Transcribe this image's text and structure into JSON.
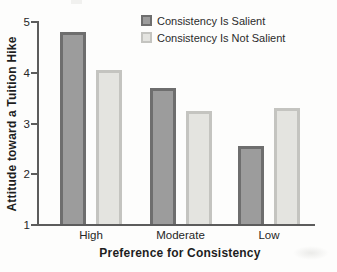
{
  "chart_data": {
    "type": "bar",
    "title": "",
    "xlabel": "Preference for Consistency",
    "ylabel": "Attitude toward a Tuition Hike",
    "categories": [
      "High",
      "Moderate",
      "Low"
    ],
    "series": [
      {
        "name": "Consistency Is Salient",
        "values": [
          4.8,
          3.7,
          2.55
        ],
        "fill_color": "#9c9c9c",
        "border_color": "#6e6e6e"
      },
      {
        "name": "Consistency Is Not Salient",
        "values": [
          4.05,
          3.25,
          3.3
        ],
        "fill_color": "#e4e4e0",
        "border_color": "#c4c4c0"
      }
    ],
    "ylim": [
      1,
      5
    ],
    "yticks": [
      1,
      2,
      3,
      4,
      5
    ],
    "grid": false,
    "legend_position": "top-center",
    "axis_color": "#5c5c5c"
  }
}
